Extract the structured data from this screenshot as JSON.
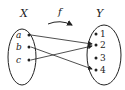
{
  "diagram": {
    "domain_label": "X",
    "codomain_label": "Y",
    "function_label": "f",
    "domain_elements": [
      "a",
      "b",
      "c"
    ],
    "codomain_elements": [
      "1",
      "2",
      "3",
      "4"
    ],
    "mappings": [
      {
        "from": "a",
        "to": "2"
      },
      {
        "from": "b",
        "to": "4"
      },
      {
        "from": "c",
        "to": "2"
      }
    ]
  }
}
